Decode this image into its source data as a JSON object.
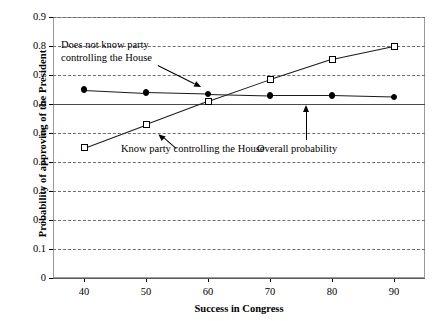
{
  "chart_data": {
    "type": "line",
    "title": "",
    "xlabel": "Success in Congress",
    "ylabel": "Probability of approving of the President",
    "xlim": [
      35,
      95
    ],
    "ylim": [
      0,
      0.9
    ],
    "xticks": [
      "40",
      "50",
      "60",
      "70",
      "80",
      "90"
    ],
    "xtick_values": [
      40,
      50,
      60,
      70,
      80,
      90
    ],
    "yticks": [
      "0",
      "0.1",
      "0.2",
      "0.3",
      "0.4",
      "0.5",
      "0.6",
      "0.7",
      "0.8",
      "0.9"
    ],
    "ytick_values": [
      0,
      0.1,
      0.2,
      0.3,
      0.4,
      0.5,
      0.6,
      0.7,
      0.8,
      0.9
    ],
    "grid": "horizontal-dashed",
    "legend": "none (inline annotations with arrows)",
    "x": [
      40,
      50,
      60,
      70,
      80,
      90
    ],
    "series": [
      {
        "name": "Does not know party controlling the House",
        "marker": "filled-circle",
        "values": [
          0.65,
          0.64,
          0.635,
          0.63,
          0.63,
          0.625
        ]
      },
      {
        "name": "Know party controlling the House",
        "marker": "open-square",
        "values": [
          0.45,
          0.53,
          0.61,
          0.685,
          0.755,
          0.8
        ]
      }
    ],
    "reference_line": {
      "name": "Overall probability",
      "orientation": "horizontal",
      "value": 0.6
    },
    "annotations": [
      {
        "id": "ann-does-not-know",
        "text": "Does not know party\ncontrolling the House",
        "points_to_series": "Does not know party controlling the House"
      },
      {
        "id": "ann-know",
        "text": "Know party controlling the House",
        "points_to_series": "Know party controlling the House"
      },
      {
        "id": "ann-overall",
        "text": "Overall probability",
        "points_to_series": "Overall probability"
      }
    ]
  },
  "annotations": {
    "does_not_know_line1": "Does not know party",
    "does_not_know_line2": "controlling the House",
    "know": "Know party controlling the House",
    "overall": "Overall probability"
  },
  "axes": {
    "y_title": "Probability of approving of the President",
    "x_title": "Success in Congress"
  },
  "colors": {
    "series": "#000000",
    "grid": "#6e6e6e",
    "frame": "#9a9a9a",
    "reference_line": "#4a4a4a"
  }
}
